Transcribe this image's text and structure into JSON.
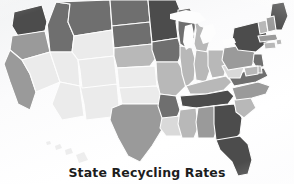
{
  "figure": {
    "title": "State Recycling Rates",
    "background_color": "#fafbfb"
  },
  "chart_data": {
    "type": "heatmap",
    "subtype": "choropleth-map",
    "title": "State Recycling Rates",
    "subtitle": "",
    "xlabel": "",
    "ylabel": "",
    "region": "United States",
    "value_unit": "recycling rate shade",
    "legend": null,
    "legend_position": "none",
    "grid": false,
    "color_scale": {
      "type": "sequential-grayscale",
      "direction": "darker = higher rate",
      "stops": [
        {
          "level": 1,
          "label": "lowest",
          "color": "#ebebeb"
        },
        {
          "level": 2,
          "label": "low",
          "color": "#d9d9d9"
        },
        {
          "level": 3,
          "label": "medium",
          "color": "#b8b8b8"
        },
        {
          "level": 4,
          "label": "medium-high",
          "color": "#9a9a9a"
        },
        {
          "level": 5,
          "label": "high",
          "color": "#6f6f6f"
        },
        {
          "level": 6,
          "label": "highest",
          "color": "#4c4c4c"
        }
      ]
    },
    "categories": [
      "Washington",
      "Oregon",
      "California",
      "Nevada",
      "Idaho",
      "Montana",
      "Wyoming",
      "Utah",
      "Arizona",
      "New Mexico",
      "Colorado",
      "North Dakota",
      "South Dakota",
      "Nebraska",
      "Kansas",
      "Oklahoma",
      "Texas",
      "Minnesota",
      "Iowa",
      "Missouri",
      "Arkansas",
      "Louisiana",
      "Wisconsin",
      "Illinois",
      "Michigan",
      "Indiana",
      "Ohio",
      "Kentucky",
      "Tennessee",
      "Mississippi",
      "Alabama",
      "Georgia",
      "Florida",
      "South Carolina",
      "North Carolina",
      "Virginia",
      "West Virginia",
      "Pennsylvania",
      "New York",
      "Maine",
      "Vermont",
      "New Hampshire",
      "Massachusetts",
      "Rhode Island",
      "Connecticut",
      "New Jersey",
      "Delaware",
      "Maryland",
      "Hawaii"
    ],
    "values": [
      6,
      4,
      4,
      1,
      5,
      5,
      1,
      1,
      1,
      1,
      1,
      5,
      5,
      3,
      1,
      1,
      4,
      6,
      5,
      3,
      5,
      2,
      5,
      3,
      3,
      3,
      3,
      3,
      6,
      3,
      4,
      6,
      6,
      3,
      4,
      5,
      2,
      4,
      6,
      6,
      3,
      4,
      4,
      3,
      3,
      5,
      3,
      3,
      2
    ],
    "value_colors": [
      "#4c4c4c",
      "#9a9a9a",
      "#9a9a9a",
      "#ebebeb",
      "#6f6f6f",
      "#6f6f6f",
      "#ebebeb",
      "#ebebeb",
      "#ebebeb",
      "#ebebeb",
      "#ebebeb",
      "#6f6f6f",
      "#6f6f6f",
      "#b8b8b8",
      "#ebebeb",
      "#ebebeb",
      "#9a9a9a",
      "#4c4c4c",
      "#6f6f6f",
      "#b8b8b8",
      "#6f6f6f",
      "#d9d9d9",
      "#6f6f6f",
      "#b8b8b8",
      "#b8b8b8",
      "#b8b8b8",
      "#b8b8b8",
      "#b8b8b8",
      "#4c4c4c",
      "#b8b8b8",
      "#9a9a9a",
      "#4c4c4c",
      "#4c4c4c",
      "#b8b8b8",
      "#9a9a9a",
      "#6f6f6f",
      "#d9d9d9",
      "#9a9a9a",
      "#4c4c4c",
      "#4c4c4c",
      "#b8b8b8",
      "#9a9a9a",
      "#9a9a9a",
      "#b8b8b8",
      "#b8b8b8",
      "#6f6f6f",
      "#b8b8b8",
      "#b8b8b8",
      "#d9d9d9"
    ],
    "annotations": []
  }
}
